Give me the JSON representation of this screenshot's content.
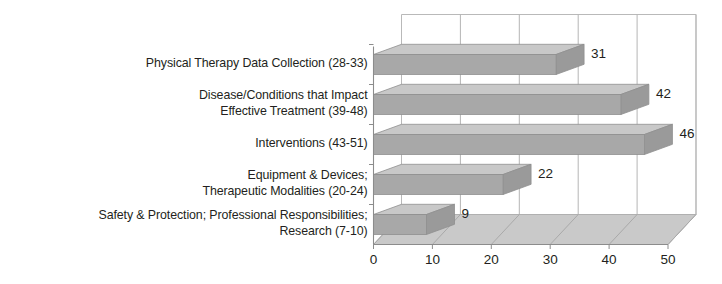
{
  "chart_data": {
    "type": "bar",
    "orientation": "horizontal",
    "style": "3d",
    "title": "",
    "subtitle": "",
    "xlabel": "",
    "ylabel": "",
    "xlim": [
      0,
      50
    ],
    "xticks": [
      0,
      10,
      20,
      30,
      40,
      50
    ],
    "xtick_labels": [
      "0",
      "10",
      "20",
      "30",
      "40",
      "50"
    ],
    "grid": true,
    "grid_axis": "x",
    "legend": false,
    "legend_position": "none",
    "categories": [
      "Physical Therapy Data Collection (28-33)",
      "Disease/Conditions that Impact\nEffective Treatment  (39-48)",
      "Interventions (43-51)",
      "Equipment & Devices;\nTherapeutic Modalities (20-24)",
      "Safety & Protection; Professional Responsibilities;\nResearch (7-10)"
    ],
    "values": [
      31,
      42,
      46,
      22,
      9
    ],
    "value_labels": [
      "31",
      "42",
      "46",
      "22",
      "9"
    ],
    "colors": {
      "bar_front": "#a8a8a8",
      "bar_top": "#c8c8c8",
      "bar_side": "#9a9a9a",
      "floor": "#c9c9c9",
      "wall": "#ffffff",
      "gridline": "#b5b5b5",
      "axis": "#8c8c8c",
      "text": "#231f20",
      "background": "#ffffff"
    }
  }
}
